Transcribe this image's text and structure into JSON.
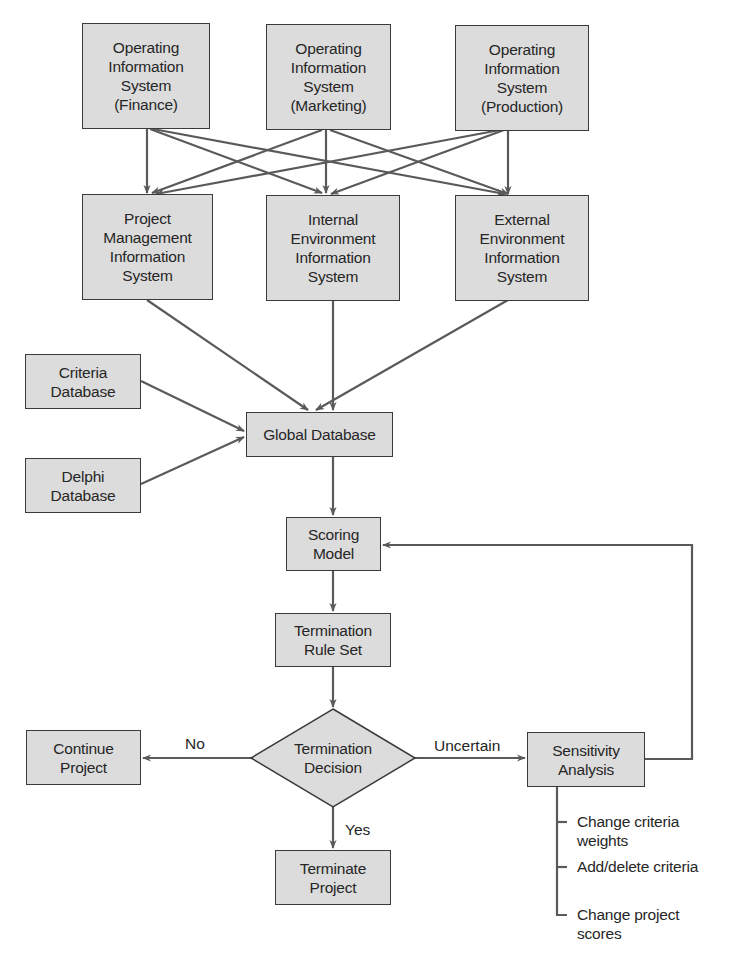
{
  "colors": {
    "box_fill": "#dcdcdc",
    "box_border": "#3a3a3a",
    "line": "#5a5a5a",
    "text": "#262626",
    "background": "#ffffff"
  },
  "nodes": {
    "ois_finance": "Operating\nInformation\nSystem\n(Finance)",
    "ois_marketing": "Operating\nInformation\nSystem\n(Marketing)",
    "ois_production": "Operating\nInformation\nSystem\n(Production)",
    "pmis": "Project\nManagement\nInformation\nSystem",
    "ieis": "Internal\nEnvironment\nInformation\nSystem",
    "eeis": "External\nEnvironment\nInformation\nSystem",
    "criteria_db": "Criteria\nDatabase",
    "delphi_db": "Delphi\nDatabase",
    "global_db": "Global Database",
    "scoring_model": "Scoring\nModel",
    "termination_rule_set": "Termination\nRule Set",
    "termination_decision": "Termination\nDecision",
    "continue_project": "Continue\nProject",
    "terminate_project": "Terminate\nProject",
    "sensitivity_analysis": "Sensitivity\nAnalysis"
  },
  "edge_labels": {
    "no": "No",
    "yes": "Yes",
    "uncertain": "Uncertain"
  },
  "sensitivity_options": [
    "Change criteria\nweights",
    "Add/delete criteria",
    "Change project\nscores"
  ]
}
